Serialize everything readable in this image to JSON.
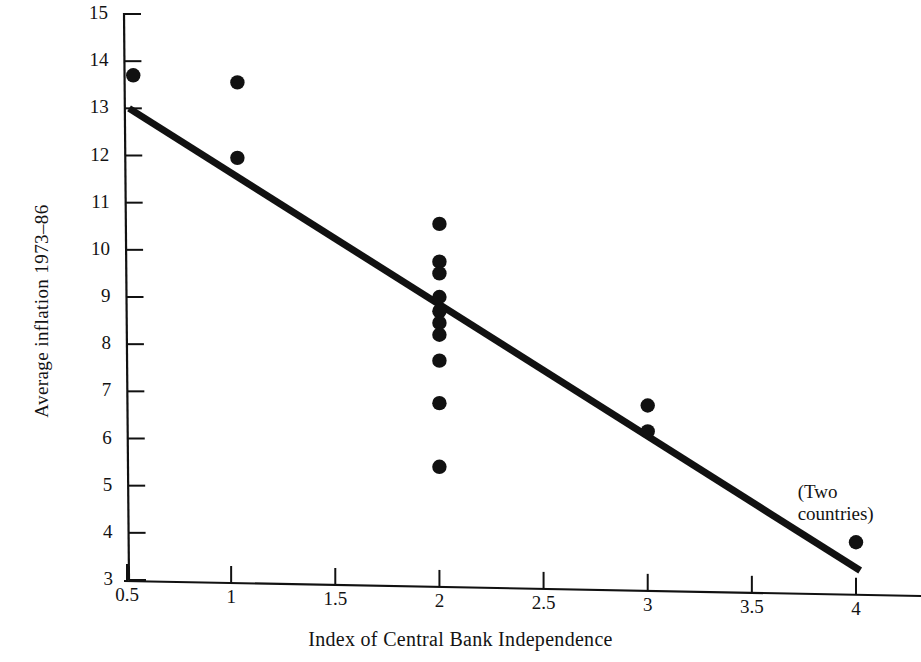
{
  "chart_data": {
    "type": "scatter",
    "title": "",
    "xlabel": "Index of Central Bank Independence",
    "ylabel": "Average inflation 1973–86",
    "xlim": [
      0.25,
      4.3
    ],
    "ylim": [
      3,
      15
    ],
    "grid": false,
    "legend": null,
    "xticks": [
      "0.5",
      "1",
      "1.5",
      "2",
      "2.5",
      "3",
      "3.5",
      "4"
    ],
    "xtick_values": [
      0.5,
      1,
      1.5,
      2,
      2.5,
      3,
      3.5,
      4
    ],
    "yticks": [
      "3",
      "4",
      "5",
      "6",
      "7",
      "8",
      "9",
      "10",
      "11",
      "12",
      "13",
      "14",
      "15"
    ],
    "ytick_values": [
      3,
      4,
      5,
      6,
      7,
      8,
      9,
      10,
      11,
      12,
      13,
      14,
      15
    ],
    "points": [
      {
        "x": 0.53,
        "y": 13.7
      },
      {
        "x": 1.03,
        "y": 13.55
      },
      {
        "x": 1.03,
        "y": 11.95
      },
      {
        "x": 2.0,
        "y": 10.55
      },
      {
        "x": 2.0,
        "y": 9.75
      },
      {
        "x": 2.0,
        "y": 9.5
      },
      {
        "x": 2.0,
        "y": 9.0
      },
      {
        "x": 2.0,
        "y": 8.7
      },
      {
        "x": 2.0,
        "y": 8.45
      },
      {
        "x": 2.0,
        "y": 8.2
      },
      {
        "x": 2.0,
        "y": 7.65
      },
      {
        "x": 2.0,
        "y": 6.75
      },
      {
        "x": 2.0,
        "y": 5.4
      },
      {
        "x": 3.0,
        "y": 6.7
      },
      {
        "x": 3.0,
        "y": 6.15
      },
      {
        "x": 4.0,
        "y": 3.8
      }
    ],
    "trendline": {
      "x_start": 0.51,
      "y_start": 13.0,
      "x_end": 4.02,
      "y_end": 3.2
    },
    "annotations": [
      {
        "text_line1": "(Two",
        "text_line2": "countries)",
        "x": 3.72,
        "y": 4.85
      }
    ],
    "marker_color": "#111111",
    "line_color": "#111111",
    "axis_color": "#111111",
    "background_color": "#ffffff"
  },
  "axis": {
    "y_title": "Average inflation 1973–86",
    "x_title": "Index of Central Bank Independence"
  },
  "annotation": {
    "two_countries_line1": "(Two",
    "two_countries_line2": "countries)"
  }
}
